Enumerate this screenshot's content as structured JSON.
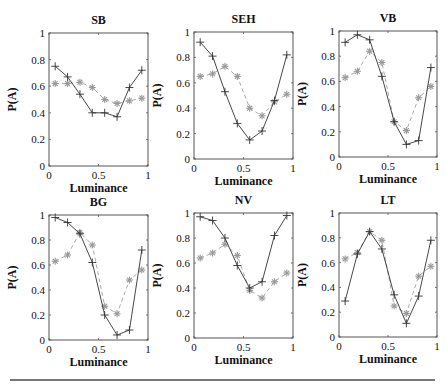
{
  "figure": {
    "ylabel": "P(A)",
    "xlabel": "Luminance",
    "xticks": [
      "0",
      "0.5",
      "1"
    ],
    "yticks": [
      "0",
      "0.2",
      "0.4",
      "0.6",
      "0.8",
      "1"
    ]
  },
  "chart_data": [
    {
      "type": "line",
      "title": "SB",
      "xlabel": "Luminance",
      "ylabel": "P(A)",
      "xlim": [
        0,
        1
      ],
      "ylim": [
        0,
        1
      ],
      "grid": false,
      "x": [
        0.0625,
        0.1875,
        0.3125,
        0.4375,
        0.5625,
        0.6875,
        0.8125,
        0.9375
      ],
      "series": [
        {
          "name": "solid-plus",
          "style": "solid line, + markers",
          "values": [
            0.75,
            0.67,
            0.54,
            0.4,
            0.4,
            0.37,
            0.59,
            0.72
          ]
        },
        {
          "name": "dashed-star",
          "style": "dashed light line, * markers",
          "values": [
            0.62,
            0.62,
            0.63,
            0.59,
            0.5,
            0.47,
            0.49,
            0.51
          ]
        }
      ]
    },
    {
      "type": "line",
      "title": "SEH",
      "xlabel": "Luminance",
      "ylabel": "P(A)",
      "xlim": [
        0,
        1
      ],
      "ylim": [
        0,
        1
      ],
      "grid": false,
      "x": [
        0.0625,
        0.1875,
        0.3125,
        0.4375,
        0.5625,
        0.6875,
        0.8125,
        0.9375
      ],
      "series": [
        {
          "name": "solid-plus",
          "style": "solid line, + markers",
          "values": [
            0.92,
            0.81,
            0.53,
            0.28,
            0.15,
            0.22,
            0.46,
            0.82
          ]
        },
        {
          "name": "dashed-star",
          "style": "dashed light line, * markers",
          "values": [
            0.65,
            0.67,
            0.73,
            0.65,
            0.4,
            0.34,
            0.45,
            0.51
          ]
        }
      ]
    },
    {
      "type": "line",
      "title": "VB",
      "xlabel": "Luminance",
      "ylabel": "P(A)",
      "xlim": [
        0,
        1
      ],
      "ylim": [
        0,
        1
      ],
      "grid": false,
      "x": [
        0.0625,
        0.1875,
        0.3125,
        0.4375,
        0.5625,
        0.6875,
        0.8125,
        0.9375
      ],
      "series": [
        {
          "name": "solid-plus",
          "style": "solid line, + markers",
          "values": [
            0.91,
            0.97,
            0.93,
            0.64,
            0.28,
            0.1,
            0.13,
            0.71
          ]
        },
        {
          "name": "dashed-star",
          "style": "dashed light line, * markers",
          "values": [
            0.63,
            0.68,
            0.84,
            0.75,
            0.28,
            0.21,
            0.47,
            0.56
          ]
        }
      ]
    },
    {
      "type": "line",
      "title": "BG",
      "xlabel": "Luminance",
      "ylabel": "P(A)",
      "xlim": [
        0,
        1
      ],
      "ylim": [
        0,
        1
      ],
      "grid": false,
      "x": [
        0.0625,
        0.1875,
        0.3125,
        0.4375,
        0.5625,
        0.6875,
        0.8125,
        0.9375
      ],
      "series": [
        {
          "name": "solid-plus",
          "style": "solid line, + markers",
          "values": [
            0.98,
            0.94,
            0.85,
            0.62,
            0.2,
            0.04,
            0.08,
            0.72
          ]
        },
        {
          "name": "dashed-star",
          "style": "dashed light line, * markers",
          "values": [
            0.63,
            0.68,
            0.86,
            0.76,
            0.27,
            0.21,
            0.48,
            0.56
          ]
        }
      ]
    },
    {
      "type": "line",
      "title": "NV",
      "xlabel": "Luminance",
      "ylabel": "P(A)",
      "xlim": [
        0,
        1
      ],
      "ylim": [
        0,
        1
      ],
      "grid": false,
      "x": [
        0.0625,
        0.1875,
        0.3125,
        0.4375,
        0.5625,
        0.6875,
        0.8125,
        0.9375
      ],
      "series": [
        {
          "name": "solid-plus",
          "style": "solid line, + markers",
          "values": [
            0.97,
            0.94,
            0.8,
            0.58,
            0.4,
            0.45,
            0.82,
            0.98
          ]
        },
        {
          "name": "dashed-star",
          "style": "dashed light line, * markers",
          "values": [
            0.64,
            0.68,
            0.75,
            0.66,
            0.38,
            0.32,
            0.45,
            0.52
          ]
        }
      ]
    },
    {
      "type": "line",
      "title": "LT",
      "xlabel": "Luminance",
      "ylabel": "P(A)",
      "xlim": [
        0,
        1
      ],
      "ylim": [
        0,
        1
      ],
      "grid": false,
      "x": [
        0.0625,
        0.1875,
        0.3125,
        0.4375,
        0.5625,
        0.6875,
        0.8125,
        0.9375
      ],
      "series": [
        {
          "name": "solid-plus",
          "style": "solid line, + markers",
          "values": [
            0.29,
            0.67,
            0.85,
            0.71,
            0.34,
            0.11,
            0.33,
            0.78
          ]
        },
        {
          "name": "dashed-star",
          "style": "dashed light line, * markers",
          "values": [
            0.63,
            0.68,
            0.85,
            0.78,
            0.25,
            0.19,
            0.49,
            0.57
          ]
        }
      ]
    }
  ],
  "colors": {
    "solid_line": "#333333",
    "dashed_line": "#aaaaaa",
    "star_marker": "#999999",
    "axis": "#555555",
    "text": "#111111"
  }
}
